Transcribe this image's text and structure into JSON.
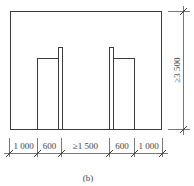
{
  "figure": {
    "caption": "(b)",
    "height_dimension": "≥3 500",
    "width_dimensions": [
      {
        "label": "1 000"
      },
      {
        "label": "600"
      },
      {
        "label": "≥1 500"
      },
      {
        "label": "600"
      },
      {
        "label": "1 000"
      }
    ],
    "line_color": "#3a3a3a"
  }
}
